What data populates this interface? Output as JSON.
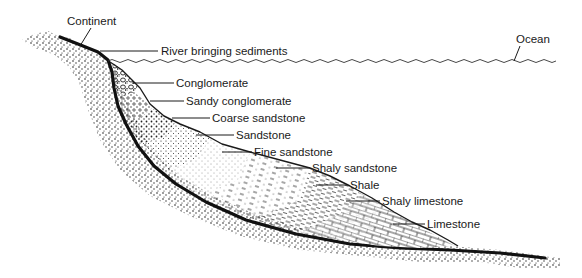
{
  "diagram": {
    "colors": {
      "background": "#ffffff",
      "ink": "#1a1a1a",
      "stipple": "#2a2a2a"
    },
    "labels": {
      "continent": "Continent",
      "river": "River bringing sediments",
      "ocean": "Ocean",
      "conglomerate": "Conglomerate",
      "sandy_conglomerate": "Sandy conglomerate",
      "coarse_sandstone": "Coarse sandstone",
      "sandstone": "Sandstone",
      "fine_sandstone": "Fine sandstone",
      "shaly_sandstone": "Shaly sandstone",
      "shale": "Shale",
      "shaly_limestone": "Shaly limestone",
      "limestone": "Limestone"
    }
  }
}
